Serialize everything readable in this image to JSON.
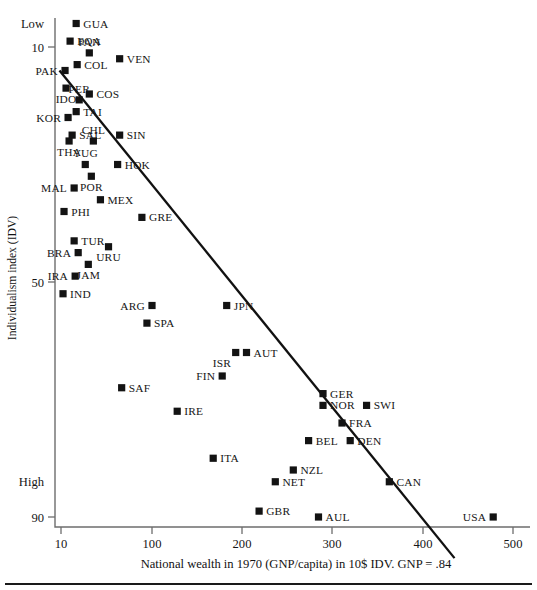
{
  "chart_data": {
    "type": "scatter",
    "title": "",
    "xlabel": "National wealth in 1970 (GNP/capita) in 10$ IDV. GNP = .84",
    "ylabel": "Individualism index (IDV)",
    "x_ticks": [
      10,
      100,
      200,
      300,
      400,
      500
    ],
    "x_tick_labels": [
      "10",
      "100",
      "200",
      "300",
      "400",
      "500"
    ],
    "y_ticks": [
      10,
      50,
      90
    ],
    "y_tick_labels": [
      "10",
      "50",
      "90"
    ],
    "y_axis_annotations": [
      {
        "label": "Low",
        "value": 6
      },
      {
        "label": "High",
        "value": 84
      }
    ],
    "y_axis_inverted": true,
    "xlim": [
      10,
      500
    ],
    "ylim": [
      2,
      92
    ],
    "grid": false,
    "legend": false,
    "xscale": "log-ish",
    "regression_line": {
      "label": "fitted regression line",
      "x_start": 8.5,
      "y_start": 14,
      "x_end": 435,
      "y_end": 97
    },
    "points": [
      {
        "label": "GUA",
        "x": 25,
        "y": 6,
        "label_pos": "right"
      },
      {
        "label": "EQA",
        "x": 19,
        "y": 9,
        "label_pos": "right"
      },
      {
        "label": "PAN",
        "x": 38,
        "y": 11,
        "label_pos": "above"
      },
      {
        "label": "PAK",
        "x": 14,
        "y": 14,
        "label_pos": "left"
      },
      {
        "label": "COL",
        "x": 26,
        "y": 13,
        "label_pos": "right"
      },
      {
        "label": "VEN",
        "x": 68,
        "y": 12,
        "label_pos": "right"
      },
      {
        "label": "IDO",
        "x": 15,
        "y": 17,
        "label_pos": "below"
      },
      {
        "label": "PER",
        "x": 28,
        "y": 19,
        "label_pos": "above"
      },
      {
        "label": "COS",
        "x": 38,
        "y": 18,
        "label_pos": "right"
      },
      {
        "label": "KOR",
        "x": 17,
        "y": 22,
        "label_pos": "left"
      },
      {
        "label": "TAI",
        "x": 25,
        "y": 21,
        "label_pos": "right"
      },
      {
        "label": "SAL",
        "x": 21,
        "y": 25,
        "label_pos": "right"
      },
      {
        "label": "THA",
        "x": 18,
        "y": 26,
        "label_pos": "below"
      },
      {
        "label": "CHL",
        "x": 42,
        "y": 26,
        "label_pos": "above"
      },
      {
        "label": "SIN",
        "x": 68,
        "y": 25,
        "label_pos": "right"
      },
      {
        "label": "YUG",
        "x": 34,
        "y": 30,
        "label_pos": "above"
      },
      {
        "label": "HOK",
        "x": 66,
        "y": 30,
        "label_pos": "right"
      },
      {
        "label": "POR",
        "x": 40,
        "y": 32,
        "label_pos": "below"
      },
      {
        "label": "MAL",
        "x": 23,
        "y": 34,
        "label_pos": "left"
      },
      {
        "label": "MEX",
        "x": 49,
        "y": 36,
        "label_pos": "right"
      },
      {
        "label": "PHI",
        "x": 13,
        "y": 38,
        "label_pos": "right"
      },
      {
        "label": "GRE",
        "x": 90,
        "y": 39,
        "label_pos": "right"
      },
      {
        "label": "TUR",
        "x": 23,
        "y": 43,
        "label_pos": "right"
      },
      {
        "label": "URU",
        "x": 57,
        "y": 44,
        "label_pos": "below"
      },
      {
        "label": "BRA",
        "x": 27,
        "y": 45,
        "label_pos": "left"
      },
      {
        "label": "JAM",
        "x": 37,
        "y": 47,
        "label_pos": "below"
      },
      {
        "label": "IRA",
        "x": 24,
        "y": 49,
        "label_pos": "left"
      },
      {
        "label": "ARG",
        "x": 100,
        "y": 54,
        "label_pos": "left"
      },
      {
        "label": "IND",
        "x": 12,
        "y": 52,
        "label_pos": "right"
      },
      {
        "label": "JPN",
        "x": 183,
        "y": 54,
        "label_pos": "right"
      },
      {
        "label": "SPA",
        "x": 95,
        "y": 57,
        "label_pos": "right"
      },
      {
        "label": "ISR",
        "x": 193,
        "y": 62,
        "label_pos": "below-left"
      },
      {
        "label": "AUT",
        "x": 205,
        "y": 62,
        "label_pos": "right"
      },
      {
        "label": "SAF",
        "x": 70,
        "y": 68,
        "label_pos": "right"
      },
      {
        "label": "FIN",
        "x": 178,
        "y": 66,
        "label_pos": "left"
      },
      {
        "label": "GER",
        "x": 290,
        "y": 69,
        "label_pos": "right"
      },
      {
        "label": "NOR",
        "x": 290,
        "y": 71,
        "label_pos": "right"
      },
      {
        "label": "SWI",
        "x": 338,
        "y": 71,
        "label_pos": "right"
      },
      {
        "label": "IRE",
        "x": 128,
        "y": 72,
        "label_pos": "right"
      },
      {
        "label": "FRA",
        "x": 311,
        "y": 74,
        "label_pos": "right"
      },
      {
        "label": "BEL",
        "x": 274,
        "y": 77,
        "label_pos": "right"
      },
      {
        "label": "DEN",
        "x": 320,
        "y": 77,
        "label_pos": "right"
      },
      {
        "label": "ITA",
        "x": 168,
        "y": 80,
        "label_pos": "right"
      },
      {
        "label": "NZL",
        "x": 257,
        "y": 82,
        "label_pos": "right"
      },
      {
        "label": "NET",
        "x": 237,
        "y": 84,
        "label_pos": "right"
      },
      {
        "label": "CAN",
        "x": 363,
        "y": 84,
        "label_pos": "right"
      },
      {
        "label": "GBR",
        "x": 219,
        "y": 89,
        "label_pos": "right"
      },
      {
        "label": "AUL",
        "x": 285,
        "y": 90,
        "label_pos": "right"
      },
      {
        "label": "USA",
        "x": 478,
        "y": 90,
        "label_pos": "left"
      }
    ]
  },
  "figure": {
    "x_axis_title": "National wealth in 1970 (GNP/capita) in 10$ IDV. GNP = .84",
    "y_axis_title": "Individualism index (IDV)"
  }
}
